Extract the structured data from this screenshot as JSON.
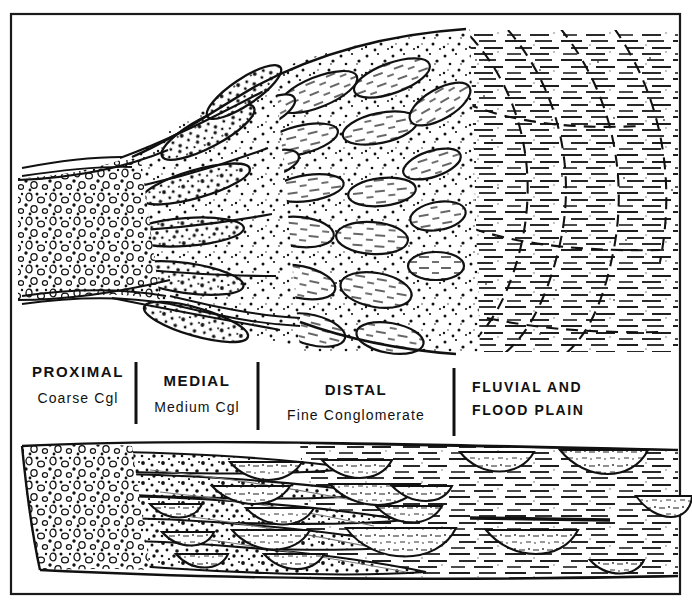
{
  "figure": {
    "frame": {
      "x": 11,
      "y": 14,
      "width": 669,
      "height": 580,
      "stroke_color": "#1a1a1a",
      "stroke_width": 2.2
    },
    "ink_color": "#111111",
    "background_color": "#ffffff"
  },
  "zones": [
    {
      "id": "proximal",
      "title": "PROXIMAL",
      "subtitle": "Coarse Cgl",
      "title_x": 78,
      "subtitle_x": 78,
      "title_y": 377,
      "subtitle_y": 403,
      "title_size": 15,
      "subtitle_size": 14,
      "pattern": "open-pebble-circles-and-dots",
      "x_start": 18,
      "x_end": 136
    },
    {
      "id": "medial",
      "title": "MEDIAL",
      "subtitle": "Medium Cgl",
      "title_x": 197,
      "subtitle_x": 197,
      "title_y": 386,
      "subtitle_y": 412,
      "title_size": 15,
      "subtitle_size": 14,
      "pattern": "stipple-with-elongate-tongues",
      "x_start": 136,
      "x_end": 258
    },
    {
      "id": "distal",
      "title": "DISTAL",
      "subtitle": "Fine Conglomerate",
      "title_x": 356,
      "subtitle_x": 356,
      "title_y": 395,
      "subtitle_y": 420,
      "title_size": 15,
      "subtitle_size": 14,
      "pattern": "dashed-lenses-in-stipple",
      "x_start": 258,
      "x_end": 454
    },
    {
      "id": "fluvial",
      "title": "FLUVIAL AND",
      "subtitle": "FLOOD PLAIN",
      "title_x": 472,
      "subtitle_x": 472,
      "title_y": 392,
      "subtitle_y": 415,
      "title_size": 14,
      "subtitle_size": 14,
      "title_anchor": "start",
      "pattern": "horizontal-dashes-with-channel-outlines",
      "x_start": 454,
      "x_end": 680
    }
  ],
  "zone_dividers": [
    {
      "x": 136,
      "y1": 362,
      "y2": 424
    },
    {
      "x": 258,
      "y1": 362,
      "y2": 430
    },
    {
      "x": 454,
      "y1": 368,
      "y2": 436
    }
  ],
  "panels": {
    "plan_view": {
      "name": "plan-view-panel",
      "y_top": 26,
      "y_bottom": 356,
      "apex_x": 18,
      "apex_y_top": 180,
      "apex_y_bottom": 300
    },
    "cross_section": {
      "name": "cross-section-panel",
      "y_top": 440,
      "y_bottom": 586,
      "apex_x": 22
    }
  },
  "legend_note": {
    "visible": false
  }
}
